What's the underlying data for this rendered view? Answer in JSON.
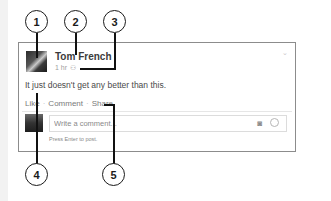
{
  "post": {
    "author": "Tom French",
    "time": "1 hr",
    "audience_icon": "friends-icon",
    "text": "It just doesn't get any better than this.",
    "options_icon": "chevron-down-icon"
  },
  "actions": {
    "like": "Like",
    "comment": "Comment",
    "share": "Share",
    "separator": "·"
  },
  "comment_box": {
    "placeholder": "Write a comment...",
    "hint": "Press Enter to post.",
    "camera_icon": "camera-icon",
    "emoji_icon": "smiley-icon"
  },
  "callouts": [
    "1",
    "2",
    "3",
    "4",
    "5"
  ]
}
